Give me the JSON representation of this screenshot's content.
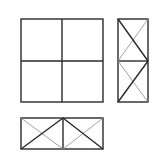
{
  "diagram": {
    "type": "three-view orthographic projection",
    "colors": {
      "background": "#ffffff",
      "line": "#2a2a2a",
      "thin_line": "#8a8a8a"
    },
    "views": [
      {
        "name": "front-view",
        "shape": "square divided into 2x2 grid",
        "bounds": {
          "x1": 21,
          "y1": 19,
          "x2": 103,
          "y2": 102
        },
        "dividers": {
          "vertical_x": 62,
          "horizontal_y": 61
        }
      },
      {
        "name": "side-view",
        "shape": "tall rectangle with 2 stacked cells, each with X diagonals",
        "bounds": {
          "x1": 118,
          "y1": 19,
          "x2": 148,
          "y2": 102
        },
        "dividers": {
          "horizontal_y": 61
        },
        "cells": [
          {
            "position": "top",
            "thick_diagonal": "top-left to bottom-right",
            "thin_diagonal": "top-right to bottom-left"
          },
          {
            "position": "bottom",
            "thick_diagonal": "bottom-left to top-right",
            "thin_diagonal": "top-left to bottom-right"
          }
        ]
      },
      {
        "name": "top-view",
        "shape": "wide rectangle with 2 side-by-side cells, each with X diagonals",
        "bounds": {
          "x1": 21,
          "y1": 118,
          "x2": 103,
          "y2": 149
        },
        "dividers": {
          "vertical_x": 63
        },
        "cells": [
          {
            "position": "left",
            "thick_diagonal": "bottom-left to top-right",
            "thin_diagonal": "top-left to bottom-right"
          },
          {
            "position": "right",
            "thick_diagonal": "top-left to bottom-right",
            "thin_diagonal": "bottom-left to top-right"
          }
        ]
      }
    ]
  }
}
